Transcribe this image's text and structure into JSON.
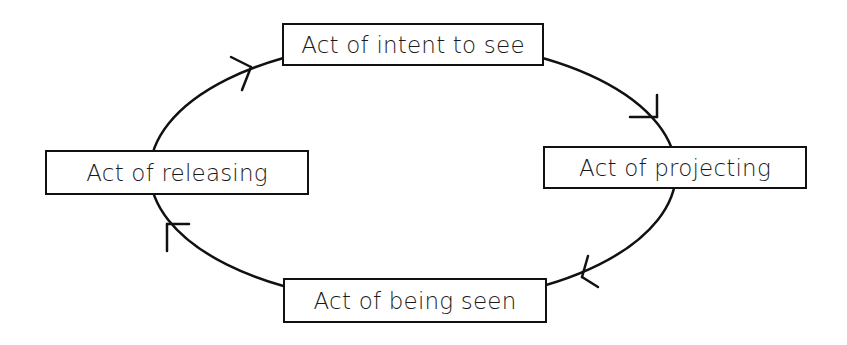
{
  "diagram": {
    "type": "cycle",
    "direction": "clockwise",
    "nodes": [
      {
        "id": "top",
        "label": "Act of intent to see"
      },
      {
        "id": "right",
        "label": "Act of projecting"
      },
      {
        "id": "bottom",
        "label": "Act of being seen"
      },
      {
        "id": "left",
        "label": "Act of releasing"
      }
    ],
    "edges": [
      {
        "from": "top",
        "to": "right"
      },
      {
        "from": "right",
        "to": "bottom"
      },
      {
        "from": "bottom",
        "to": "left"
      },
      {
        "from": "left",
        "to": "top"
      }
    ],
    "colors": {
      "line": "#111111",
      "background": "#ffffff",
      "text": "#1a1a1a"
    }
  }
}
